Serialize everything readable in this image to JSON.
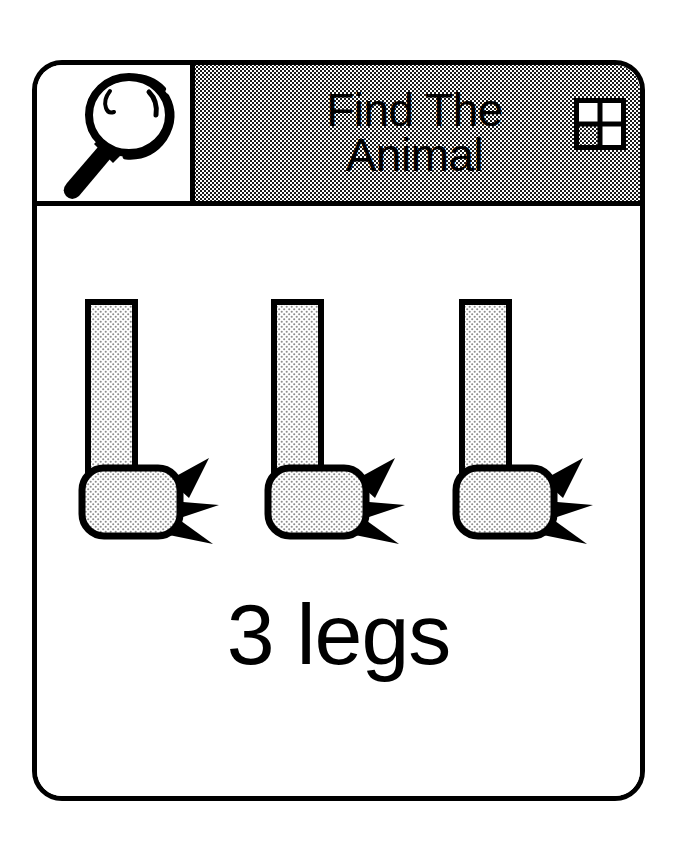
{
  "card": {
    "header": {
      "magnifier_icon": "magnifying-glass-icon",
      "title": "Find The\nAnimal",
      "grid_icon": "grid-2x2-icon",
      "grid_icon_filled_cell": "bottom-left"
    },
    "body": {
      "figure_count": 3,
      "figures": [
        {
          "name": "leg",
          "claws": 3
        },
        {
          "name": "leg",
          "claws": 3
        },
        {
          "name": "leg",
          "claws": 3
        }
      ],
      "caption": "3 legs"
    }
  },
  "colors": {
    "outline": "#000000",
    "page_background": "#ffffff",
    "card_background": "#ffffff",
    "header_band": "#9a9a9a",
    "figure_fill": "#efefef",
    "claw_fill": "#000000"
  }
}
